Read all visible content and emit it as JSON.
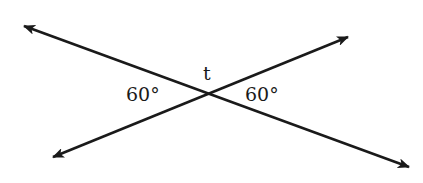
{
  "diagram": {
    "type": "intersecting-lines",
    "intersection_label": "t",
    "angles": [
      {
        "position": "left",
        "value": "60°"
      },
      {
        "position": "right",
        "value": "60°"
      }
    ],
    "lines": [
      {
        "name": "line-1",
        "from": [
          24,
          26
        ],
        "to": [
          409,
          167
        ],
        "arrows": "both"
      },
      {
        "name": "line-2",
        "from": [
          53,
          157
        ],
        "to": [
          348,
          37
        ],
        "arrows": "both"
      }
    ],
    "stroke_color": "#1a1a1a"
  }
}
